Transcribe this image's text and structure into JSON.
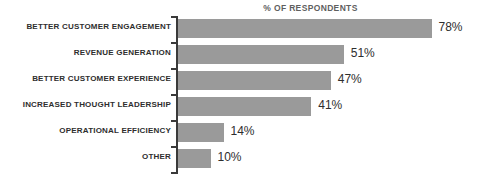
{
  "chart_data": {
    "type": "bar",
    "orientation": "horizontal",
    "title": "% OF RESPONDENTS",
    "xlabel": "",
    "ylabel": "",
    "xlim": [
      0,
      80
    ],
    "grid": false,
    "legend": null,
    "value_suffix": "%",
    "categories": [
      "BETTER CUSTOMER ENGAGEMENT",
      "REVENUE GENERATION",
      "BETTER CUSTOMER EXPERIENCE",
      "INCREASED THOUGHT LEADERSHIP",
      "OPERATIONAL EFFICIENCY",
      "OTHER"
    ],
    "values": [
      78,
      51,
      47,
      41,
      14,
      10
    ],
    "value_labels": [
      "78%",
      "51%",
      "47%",
      "41%",
      "14%",
      "10%"
    ],
    "colors": {
      "bar": "#9a9a9a",
      "axis": "#3a3a3a",
      "label_text": "#2e2e2e",
      "title_text": "#5f5f5f",
      "background": "#ffffff"
    }
  }
}
